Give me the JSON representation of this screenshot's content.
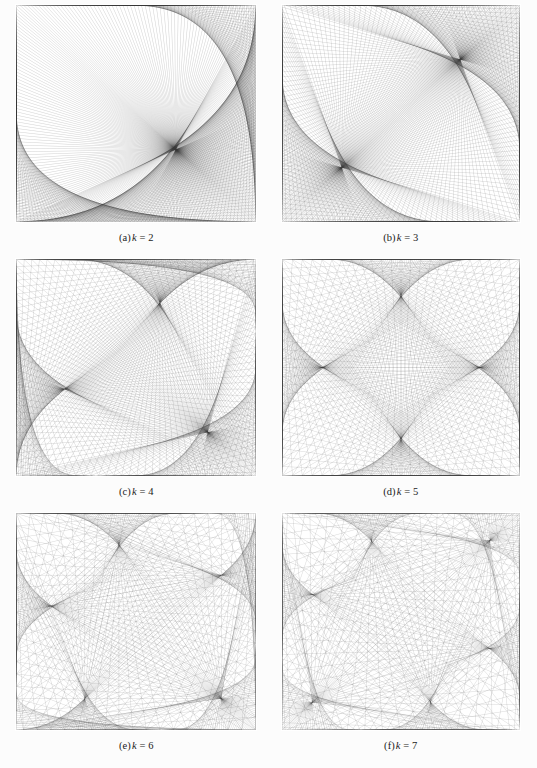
{
  "figure": {
    "background_color": "#fcfcfc",
    "panel_background_color": "#ffffff",
    "line_color": "#3a3a3a",
    "columns": 2,
    "rows": 3,
    "panel_count": 6
  },
  "panels": [
    {
      "id": "panel-a",
      "tag": "(a)",
      "variable": "k",
      "equals": "= 2",
      "caption": "(a) k = 2",
      "k": 2,
      "points": 520,
      "cusps": 1,
      "line_width": 0.28,
      "line_alpha": 0.42
    },
    {
      "id": "panel-b",
      "tag": "(b)",
      "variable": "k",
      "equals": "= 3",
      "caption": "(b) k = 3",
      "k": 3,
      "points": 520,
      "cusps": 2,
      "line_width": 0.28,
      "line_alpha": 0.4
    },
    {
      "id": "panel-c",
      "tag": "(c)",
      "variable": "k",
      "equals": "= 4",
      "caption": "(c) k = 4",
      "k": 4,
      "points": 500,
      "cusps": 3,
      "line_width": 0.28,
      "line_alpha": 0.38
    },
    {
      "id": "panel-d",
      "tag": "(d)",
      "variable": "k",
      "equals": "= 5",
      "caption": "(d) k = 5",
      "k": 5,
      "points": 480,
      "cusps": 4,
      "line_width": 0.28,
      "line_alpha": 0.36
    },
    {
      "id": "panel-e",
      "tag": "(e)",
      "variable": "k",
      "equals": "= 6",
      "caption": "(e) k = 6",
      "k": 6,
      "points": 420,
      "cusps": 5,
      "line_width": 0.3,
      "line_alpha": 0.34
    },
    {
      "id": "panel-f",
      "tag": "(f)",
      "variable": "k",
      "equals": "= 7",
      "caption": "(f) k = 7",
      "k": 7,
      "points": 380,
      "cusps": 6,
      "line_width": 0.3,
      "line_alpha": 0.34
    }
  ],
  "chart_data": {
    "type": "line",
    "xlabel": "",
    "ylabel": "",
    "series": [
      {
        "name": "(a) k = 2",
        "k": 2,
        "points": 520
      },
      {
        "name": "(b) k = 3",
        "k": 3,
        "points": 520
      },
      {
        "name": "(c) k = 4",
        "k": 4,
        "points": 500
      },
      {
        "name": "(d) k = 5",
        "k": 5,
        "points": 480
      },
      {
        "name": "(e) k = 6",
        "k": 6,
        "points": 420
      },
      {
        "name": "(f) k = 7",
        "k": 7,
        "points": 380
      }
    ],
    "categories": [
      "(a) k = 2",
      "(b) k = 3",
      "(c) k = 4",
      "(d) k = 5",
      "(e) k = 6",
      "(f) k = 7"
    ],
    "values": [
      2,
      3,
      4,
      5,
      6,
      7
    ],
    "grid": false,
    "legend_position": "none"
  }
}
